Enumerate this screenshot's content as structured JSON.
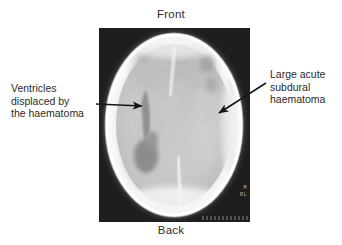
{
  "figure": {
    "background_color": "#ffffff",
    "text_color": "#2b2b2b"
  },
  "orientation": {
    "front_label": "Front",
    "back_label": "Back"
  },
  "annotations": {
    "left": {
      "name": "ventricles-annotation",
      "lines": [
        "Ventricles",
        "displaced by",
        "the haematoma"
      ],
      "arrow": {
        "from_x": 96,
        "from_y": 104,
        "to_x": 144,
        "to_y": 106,
        "direction": "right"
      }
    },
    "right": {
      "name": "haematoma-annotation",
      "lines": [
        "Large acute",
        "subdural",
        "haematoma"
      ],
      "arrow": {
        "from_x": 266,
        "from_y": 83,
        "to_x": 217,
        "to_y": 114,
        "direction": "down-left"
      }
    }
  },
  "scan": {
    "modality": "CT",
    "plane": "axial",
    "plate": {
      "x": 99,
      "y": 28,
      "width": 151,
      "height": 194
    },
    "film_background": "#141414",
    "skull_color": "#fbfbfb",
    "brain_color": "#c9c9c9",
    "haematoma_color": "#f2f2f2",
    "ventricle_color": "#8e8e8e",
    "corner_markers": [
      "M",
      "RL"
    ],
    "findings": [
      "Large acute subdural haematoma along right convexity",
      "Ventricles displaced across the midline",
      "Midline shift"
    ]
  }
}
